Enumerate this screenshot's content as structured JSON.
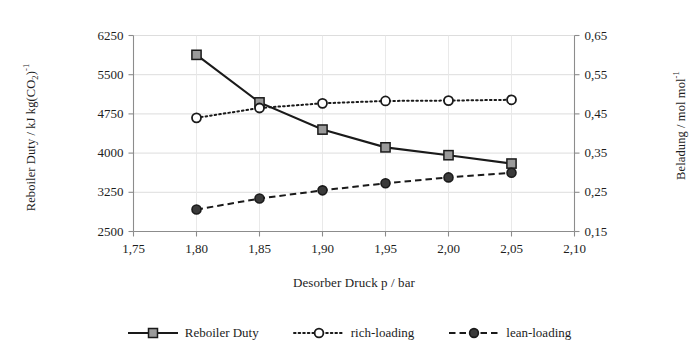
{
  "chart_data": {
    "type": "line",
    "title": "",
    "xlabel": "Desorber Druck p / bar",
    "ylabel": "Reboiler Duty / kJ kg(CO2)-1",
    "ylabel_right": "Beladung / mol mol-1",
    "x": [
      1.8,
      1.85,
      1.9,
      1.95,
      2.0,
      2.05
    ],
    "xlim": [
      1.75,
      2.1
    ],
    "xticks": [
      "1,75",
      "1,80",
      "1,85",
      "1,90",
      "1,95",
      "2,00",
      "2,05",
      "2,10"
    ],
    "xtick_values": [
      1.75,
      1.8,
      1.85,
      1.9,
      1.95,
      2.0,
      2.05,
      2.1
    ],
    "ylim": [
      2500,
      6250
    ],
    "yticks": [
      "2500",
      "3250",
      "4000",
      "4750",
      "5500",
      "6250"
    ],
    "ytick_values": [
      2500,
      3250,
      4000,
      4750,
      5500,
      6250
    ],
    "ylim_right": [
      0.15,
      0.65
    ],
    "yticks_right": [
      "0,15",
      "0,25",
      "0,35",
      "0,45",
      "0,55",
      "0,65"
    ],
    "ytick_right_values": [
      0.15,
      0.25,
      0.35,
      0.45,
      0.55,
      0.65
    ],
    "grid": true,
    "legend_position": "bottom",
    "series": [
      {
        "name": "Reboiler Duty",
        "axis": "left",
        "linestyle": "solid",
        "marker": "square",
        "marker_fill": "#9a9a9a",
        "color": "#1a1a1a",
        "values": [
          5880,
          4970,
          4450,
          4110,
          3960,
          3800
        ]
      },
      {
        "name": "rich-loading",
        "axis": "right",
        "linestyle": "dotted",
        "marker": "circle-open",
        "marker_fill": "#ffffff",
        "color": "#1a1a1a",
        "values": [
          0.44,
          0.465,
          0.477,
          0.483,
          0.484,
          0.486
        ]
      },
      {
        "name": "lean-loading",
        "axis": "right",
        "linestyle": "dashed",
        "marker": "circle-filled",
        "marker_fill": "#3a3a3a",
        "color": "#1a1a1a",
        "values": [
          0.206,
          0.234,
          0.255,
          0.273,
          0.288,
          0.3
        ]
      }
    ]
  },
  "legend": {
    "items": [
      {
        "label": "Reboiler Duty"
      },
      {
        "label": "rich-loading"
      },
      {
        "label": "lean-loading"
      }
    ]
  },
  "colors": {
    "axis": "#8c8c8c",
    "grid": "#d9d9d9",
    "line": "#1a1a1a",
    "text": "#1d1d1d"
  }
}
